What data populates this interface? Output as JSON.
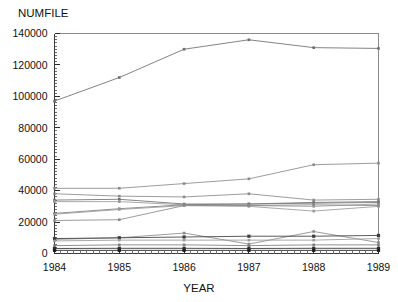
{
  "chart_data": {
    "type": "line",
    "title": "",
    "ylabel": "NUMFILE",
    "xlabel": "YEAR",
    "categories": [
      "1984",
      "1985",
      "1986",
      "1987",
      "1988",
      "1989"
    ],
    "x": [
      1984,
      1985,
      1986,
      1987,
      1988,
      1989
    ],
    "xlim": [
      1984,
      1989
    ],
    "ylim": [
      0,
      140000
    ],
    "yticks": [
      0,
      20000,
      40000,
      60000,
      80000,
      100000,
      120000,
      140000
    ],
    "ytick_labels": [
      "0",
      "20000",
      "40000",
      "60000",
      "80000",
      "100000",
      "120000",
      "140000"
    ],
    "xticks": [
      1984,
      1985,
      1986,
      1987,
      1988,
      1989
    ],
    "xtick_labels": [
      "1984",
      "1985",
      "1986",
      "1987",
      "1988",
      "1989"
    ],
    "grid": false,
    "legend": "none",
    "marker": "square",
    "series": [
      {
        "name": "series-1",
        "values": [
          97000,
          112000,
          130000,
          136000,
          131000,
          130500
        ],
        "color": "#6d6d6d",
        "width": 0.85
      },
      {
        "name": "series-2",
        "values": [
          41500,
          41500,
          44500,
          47500,
          56500,
          57500
        ],
        "color": "#8a8a8a",
        "width": 0.85
      },
      {
        "name": "series-3",
        "values": [
          38000,
          36500,
          36000,
          38000,
          34000,
          34500
        ],
        "color": "#8a8a8a",
        "width": 0.85
      },
      {
        "name": "series-4",
        "values": [
          34000,
          34500,
          31500,
          31500,
          32500,
          33000
        ],
        "color": "#707070",
        "width": 1.05
      },
      {
        "name": "series-5",
        "values": [
          33000,
          33000,
          31000,
          30500,
          30000,
          31500
        ],
        "color": "#9a9a9a",
        "width": 0.85
      },
      {
        "name": "series-6",
        "values": [
          25500,
          28500,
          31000,
          31500,
          32000,
          32500
        ],
        "color": "#7c7c7c",
        "width": 0.85
      },
      {
        "name": "series-7",
        "values": [
          25000,
          28000,
          30500,
          30000,
          27000,
          30000
        ],
        "color": "#9a9a9a",
        "width": 0.85
      },
      {
        "name": "series-8",
        "values": [
          21000,
          21500,
          30500,
          30500,
          31000,
          30500
        ],
        "color": "#8a8a8a",
        "width": 0.85
      },
      {
        "name": "series-9",
        "values": [
          9000,
          10000,
          13000,
          6000,
          14000,
          7000
        ],
        "color": "#8a8a8a",
        "width": 0.85
      },
      {
        "name": "series-10",
        "values": [
          9500,
          10000,
          10500,
          11000,
          11000,
          11500
        ],
        "color": "#3d3d3d",
        "width": 1.2
      },
      {
        "name": "series-11",
        "values": [
          8000,
          8500,
          8500,
          8500,
          8500,
          9500
        ],
        "color": "#9a9a9a",
        "width": 0.85
      },
      {
        "name": "series-12",
        "values": [
          5000,
          5500,
          5500,
          5000,
          5500,
          5500
        ],
        "color": "#7c7c7c",
        "width": 0.9
      },
      {
        "name": "series-13",
        "values": [
          3200,
          3300,
          3300,
          3200,
          3300,
          3300
        ],
        "color": "#2e2e2e",
        "width": 1.3
      },
      {
        "name": "series-14",
        "values": [
          2000,
          2000,
          2000,
          2000,
          2000,
          2000
        ],
        "color": "#1f1f1f",
        "width": 1.4
      }
    ]
  },
  "labels": {
    "y_axis_title": "NUMFILE",
    "x_axis_title": "YEAR"
  }
}
